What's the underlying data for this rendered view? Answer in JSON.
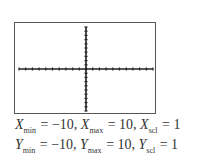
{
  "chart_data": {
    "type": "line",
    "title": "",
    "series": [],
    "xlabel": "",
    "ylabel": "",
    "xlim": [
      -10,
      10
    ],
    "ylim": [
      -10,
      10
    ],
    "xscl": 1,
    "yscl": 1,
    "grid": false,
    "axes_visible": true
  },
  "window": {
    "line1": {
      "xmin_var": "X",
      "xmin_sub": "min",
      "xmin_val": " = −10, ",
      "xmax_var": "X",
      "xmax_sub": "max",
      "xmax_val": " = 10, ",
      "xscl_var": "X",
      "xscl_sub": "scl",
      "xscl_val": " = 1"
    },
    "line2": {
      "ymin_var": "Y",
      "ymin_sub": "min",
      "ymin_val": " = −10, ",
      "ymax_var": "Y",
      "ymax_sub": "max",
      "ymax_val": " = 10, ",
      "yscl_var": "Y",
      "yscl_sub": "scl",
      "yscl_val": " = 1"
    }
  }
}
